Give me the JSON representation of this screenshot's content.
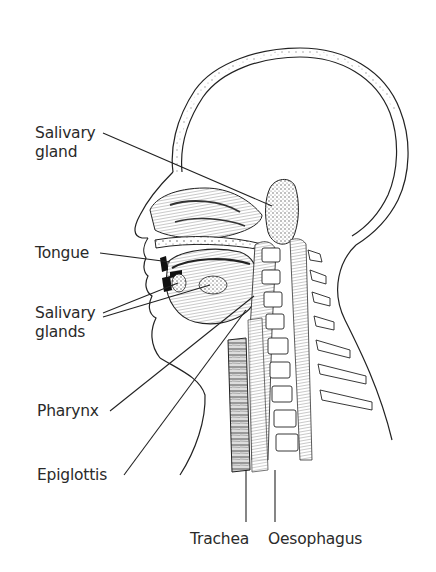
{
  "diagram": {
    "type": "anatomical-cross-section",
    "labels": [
      {
        "id": "salivary-gland",
        "lines": [
          "Salivary",
          "gland"
        ],
        "x": 35,
        "y": 124
      },
      {
        "id": "tongue",
        "lines": [
          "Tongue"
        ],
        "x": 35,
        "y": 245
      },
      {
        "id": "salivary-glands",
        "lines": [
          "Salivary",
          "glands"
        ],
        "x": 35,
        "y": 304
      },
      {
        "id": "pharynx",
        "lines": [
          "Pharynx"
        ],
        "x": 37,
        "y": 402
      },
      {
        "id": "epiglottis",
        "lines": [
          "Epiglottis"
        ],
        "x": 37,
        "y": 466
      },
      {
        "id": "trachea",
        "lines": [
          "Trachea"
        ],
        "x": 190,
        "y": 530
      },
      {
        "id": "oesophagus",
        "lines": [
          "Oesophagus"
        ],
        "x": 268,
        "y": 530
      }
    ]
  },
  "colors": {
    "line": "#222222",
    "text": "#2a2a2a",
    "shade": "#8a8a8a",
    "background": "#ffffff"
  }
}
